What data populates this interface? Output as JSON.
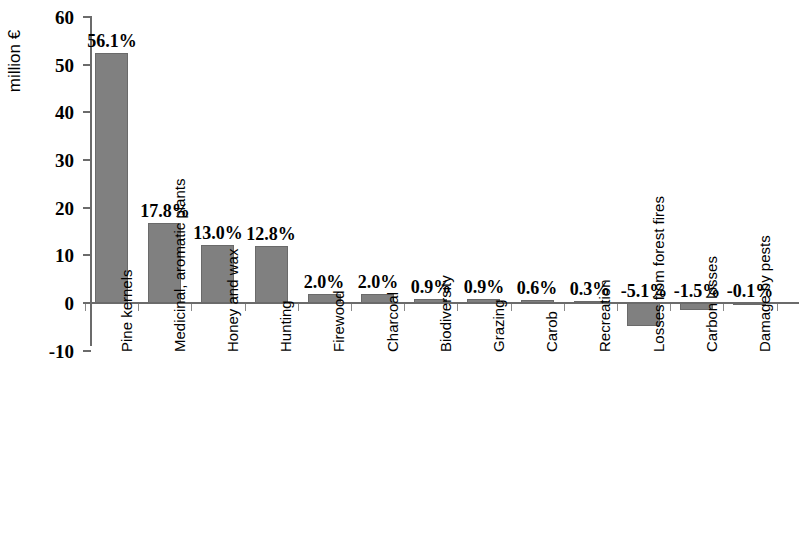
{
  "chart_data": {
    "type": "bar",
    "title": "",
    "xlabel": "",
    "ylabel": "million €",
    "ylim": [
      -10,
      60
    ],
    "yticks": [
      60,
      50,
      40,
      30,
      20,
      10,
      0,
      -10
    ],
    "ytick_labels": [
      "60",
      "50",
      "40",
      "30",
      "20",
      "10",
      "0",
      "-10"
    ],
    "grid": false,
    "legend": false,
    "bar_color": "#808080",
    "categories": [
      "Pine kernels",
      "Medicinal, aromatic plants",
      "Honey and wax",
      "Hunting",
      "Firewood",
      "Charcoal",
      "Biodiversity",
      "Grazing",
      "Carob",
      "Recreation",
      "Losses from forest fires",
      "Carbon losses",
      "Damage by pests"
    ],
    "values": [
      52.5,
      16.7,
      12.2,
      12.0,
      1.9,
      1.9,
      0.85,
      0.85,
      0.56,
      0.28,
      -4.8,
      -1.4,
      -0.1
    ],
    "data_labels": [
      "56.1%",
      "17.8%",
      "13.0%",
      "12.8%",
      "2.0%",
      "2.0%",
      "0.9%",
      "0.9%",
      "0.6%",
      "0.3%",
      "-5.1%",
      "-1.5%",
      "-0.1%"
    ],
    "percentages": [
      56.1,
      17.8,
      13.0,
      12.8,
      2.0,
      2.0,
      0.9,
      0.9,
      0.6,
      0.3,
      -5.1,
      -1.5,
      -0.1
    ]
  }
}
